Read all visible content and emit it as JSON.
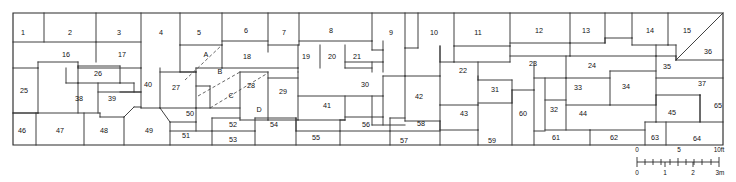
{
  "figure": {
    "type": "site-plan",
    "extent": {
      "x": 13,
      "y": 13,
      "width": 710,
      "height": 132
    },
    "line_color": "#2b2b2b",
    "background_color": "#ffffff",
    "dashed_line_color": "#4a4a4a"
  },
  "rooms": [
    {
      "id": "1",
      "label": "1",
      "lx": 23,
      "ly": 33
    },
    {
      "id": "2",
      "label": "2",
      "lx": 70,
      "ly": 33
    },
    {
      "id": "3",
      "label": "3",
      "lx": 119,
      "ly": 33
    },
    {
      "id": "4",
      "label": "4",
      "lx": 161,
      "ly": 33
    },
    {
      "id": "5",
      "label": "5",
      "lx": 199,
      "ly": 33
    },
    {
      "id": "6",
      "label": "6",
      "lx": 246,
      "ly": 31
    },
    {
      "id": "7",
      "label": "7",
      "lx": 284,
      "ly": 33
    },
    {
      "id": "8",
      "label": "8",
      "lx": 331,
      "ly": 31
    },
    {
      "id": "9",
      "label": "9",
      "lx": 391,
      "ly": 33
    },
    {
      "id": "10",
      "label": "10",
      "lx": 434,
      "ly": 33
    },
    {
      "id": "11",
      "label": "11",
      "lx": 478,
      "ly": 33
    },
    {
      "id": "12",
      "label": "12",
      "lx": 539,
      "ly": 31
    },
    {
      "id": "13",
      "label": "13",
      "lx": 586,
      "ly": 31
    },
    {
      "id": "14",
      "label": "14",
      "lx": 650,
      "ly": 31
    },
    {
      "id": "15",
      "label": "15",
      "lx": 687,
      "ly": 31
    },
    {
      "id": "16",
      "label": "16",
      "lx": 66,
      "ly": 55
    },
    {
      "id": "17",
      "label": "17",
      "lx": 122,
      "ly": 55
    },
    {
      "id": "18",
      "label": "18",
      "lx": 247,
      "ly": 57
    },
    {
      "id": "19",
      "label": "19",
      "lx": 306,
      "ly": 57
    },
    {
      "id": "20",
      "label": "20",
      "lx": 332,
      "ly": 57
    },
    {
      "id": "21",
      "label": "21",
      "lx": 357,
      "ly": 57
    },
    {
      "id": "22",
      "label": "22",
      "lx": 463,
      "ly": 71
    },
    {
      "id": "23",
      "label": "23",
      "lx": 533,
      "ly": 64
    },
    {
      "id": "24",
      "label": "24",
      "lx": 592,
      "ly": 66
    },
    {
      "id": "25",
      "label": "25",
      "lx": 24,
      "ly": 91
    },
    {
      "id": "26",
      "label": "26",
      "lx": 98,
      "ly": 74
    },
    {
      "id": "27",
      "label": "27",
      "lx": 176,
      "ly": 88
    },
    {
      "id": "28",
      "label": "28",
      "lx": 251,
      "ly": 86
    },
    {
      "id": "29",
      "label": "29",
      "lx": 283,
      "ly": 92
    },
    {
      "id": "30",
      "label": "30",
      "lx": 365,
      "ly": 85
    },
    {
      "id": "31",
      "label": "31",
      "lx": 495,
      "ly": 90
    },
    {
      "id": "32",
      "label": "32",
      "lx": 554,
      "ly": 110
    },
    {
      "id": "33",
      "label": "33",
      "lx": 578,
      "ly": 88
    },
    {
      "id": "34",
      "label": "34",
      "lx": 626,
      "ly": 87
    },
    {
      "id": "35",
      "label": "35",
      "lx": 667,
      "ly": 67
    },
    {
      "id": "36",
      "label": "36",
      "lx": 708,
      "ly": 52
    },
    {
      "id": "37",
      "label": "37",
      "lx": 702,
      "ly": 84
    },
    {
      "id": "38",
      "label": "38",
      "lx": 79,
      "ly": 99
    },
    {
      "id": "39",
      "label": "39",
      "lx": 112,
      "ly": 99
    },
    {
      "id": "40",
      "label": "40",
      "lx": 148,
      "ly": 85
    },
    {
      "id": "41",
      "label": "41",
      "lx": 327,
      "ly": 106
    },
    {
      "id": "42",
      "label": "42",
      "lx": 419,
      "ly": 97
    },
    {
      "id": "43",
      "label": "43",
      "lx": 464,
      "ly": 114
    },
    {
      "id": "44",
      "label": "44",
      "lx": 583,
      "ly": 114
    },
    {
      "id": "45",
      "label": "45",
      "lx": 672,
      "ly": 113
    },
    {
      "id": "46",
      "label": "46",
      "lx": 22,
      "ly": 131
    },
    {
      "id": "47",
      "label": "47",
      "lx": 60,
      "ly": 131
    },
    {
      "id": "48",
      "label": "48",
      "lx": 104,
      "ly": 131
    },
    {
      "id": "49",
      "label": "49",
      "lx": 149,
      "ly": 131
    },
    {
      "id": "50",
      "label": "50",
      "lx": 190,
      "ly": 114
    },
    {
      "id": "51",
      "label": "51",
      "lx": 186,
      "ly": 136
    },
    {
      "id": "52",
      "label": "52",
      "lx": 233,
      "ly": 125
    },
    {
      "id": "53",
      "label": "53",
      "lx": 233,
      "ly": 140
    },
    {
      "id": "54",
      "label": "54",
      "lx": 274,
      "ly": 125
    },
    {
      "id": "55",
      "label": "55",
      "lx": 316,
      "ly": 138
    },
    {
      "id": "56",
      "label": "56",
      "lx": 366,
      "ly": 125
    },
    {
      "id": "57",
      "label": "57",
      "lx": 404,
      "ly": 141
    },
    {
      "id": "58",
      "label": "58",
      "lx": 421,
      "ly": 124
    },
    {
      "id": "59",
      "label": "59",
      "lx": 492,
      "ly": 141
    },
    {
      "id": "60",
      "label": "60",
      "lx": 523,
      "ly": 114
    },
    {
      "id": "61",
      "label": "61",
      "lx": 556,
      "ly": 138
    },
    {
      "id": "62",
      "label": "62",
      "lx": 614,
      "ly": 138
    },
    {
      "id": "63",
      "label": "63",
      "lx": 655,
      "ly": 138
    },
    {
      "id": "64",
      "label": "64",
      "lx": 697,
      "ly": 139
    },
    {
      "id": "65",
      "label": "65",
      "lx": 718,
      "ly": 106
    }
  ],
  "lettered_areas": [
    {
      "id": "A",
      "label": "A",
      "lx": 206,
      "ly": 55
    },
    {
      "id": "B",
      "label": "B",
      "lx": 220,
      "ly": 72
    },
    {
      "id": "C",
      "label": "C",
      "lx": 231,
      "ly": 96
    },
    {
      "id": "D",
      "label": "D",
      "lx": 259,
      "ly": 110
    }
  ],
  "scale_bar": {
    "top_unit_labels": [
      {
        "text": "0",
        "x": 637,
        "y": 150
      },
      {
        "text": "5",
        "x": 679,
        "y": 150
      },
      {
        "text": "10ft",
        "x": 719,
        "y": 150
      }
    ],
    "bottom_unit_labels": [
      {
        "text": "0",
        "x": 637,
        "y": 173
      },
      {
        "text": "1",
        "x": 665,
        "y": 173
      },
      {
        "text": "2",
        "x": 693,
        "y": 173
      },
      {
        "text": "3m",
        "x": 720,
        "y": 173
      }
    ],
    "axis_start_x": 637,
    "axis_end_x": 719,
    "axis_y": 162,
    "feet_range": [
      0,
      10
    ],
    "meters_range": [
      0,
      3
    ]
  }
}
